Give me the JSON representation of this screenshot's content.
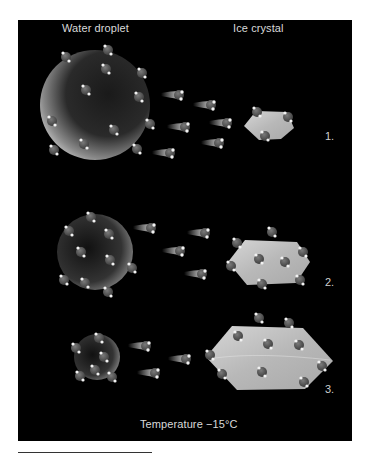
{
  "figure": {
    "headers": {
      "left": "Water droplet",
      "right": "Ice crystal"
    },
    "steps": [
      {
        "label": "1.",
        "droplet": {
          "cx": 95,
          "cy": 105,
          "r": 55
        },
        "crystal": {
          "points": "244,126 256,111 287,112 294,128 281,139 259,140"
        }
      },
      {
        "label": "2.",
        "droplet": {
          "cx": 95,
          "cy": 252,
          "r": 38
        },
        "crystal": {
          "points": "228,262 245,240 297,242 310,262 296,283 247,285"
        }
      },
      {
        "label": "3.",
        "droplet": {
          "cx": 97,
          "cy": 357,
          "r": 23
        },
        "crystal": {
          "points": "206,357 232,326 303,328 333,361 305,389 237,390"
        }
      }
    ],
    "footer": "Temperature −15°C",
    "colors": {
      "background": "#000000",
      "molecule": "#555555",
      "hydrogen": "#f2f2f2",
      "crystal": "#bdbdbd",
      "text": "#d9d9d9"
    }
  }
}
